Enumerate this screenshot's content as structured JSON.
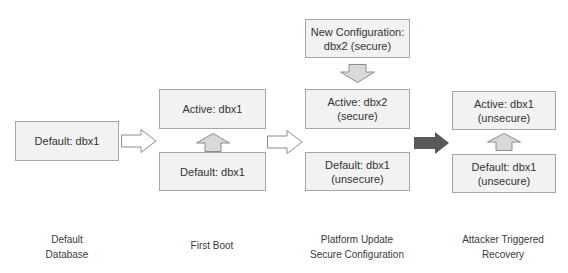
{
  "diagram": {
    "stages": [
      {
        "caption": [
          "Default",
          "Database"
        ],
        "boxes": [
          {
            "role": "default",
            "lines": [
              "Default: dbx1"
            ]
          }
        ]
      },
      {
        "caption": [
          "First Boot"
        ],
        "boxes": [
          {
            "role": "active",
            "lines": [
              "Active: dbx1"
            ]
          },
          {
            "role": "default",
            "lines": [
              "Default: dbx1"
            ]
          }
        ]
      },
      {
        "caption": [
          "Platform Update",
          "Secure Configuration"
        ],
        "boxes": [
          {
            "role": "new-config",
            "lines": [
              "New Configuration:",
              "dbx2 (secure)"
            ]
          },
          {
            "role": "active",
            "lines": [
              "Active: dbx2",
              "(secure)"
            ]
          },
          {
            "role": "default",
            "lines": [
              "Default: dbx1",
              "(unsecure)"
            ]
          }
        ]
      },
      {
        "caption": [
          "Attacker Triggered",
          "Recovery"
        ],
        "boxes": [
          {
            "role": "active",
            "lines": [
              "Active: dbx1",
              "(unsecure)"
            ]
          },
          {
            "role": "default",
            "lines": [
              "Default: dbx1",
              "(unsecure)"
            ]
          }
        ]
      }
    ],
    "arrows": [
      {
        "from": "stage-1",
        "to": "stage-2",
        "style": "outline",
        "direction": "right"
      },
      {
        "from": "stage-2-default",
        "to": "stage-2-active",
        "style": "gray-filled",
        "direction": "up"
      },
      {
        "from": "stage-2",
        "to": "stage-3",
        "style": "outline",
        "direction": "right"
      },
      {
        "from": "stage-3-new-config",
        "to": "stage-3-active",
        "style": "gray-filled",
        "direction": "down"
      },
      {
        "from": "stage-3",
        "to": "stage-4",
        "style": "dark-filled",
        "direction": "right"
      },
      {
        "from": "stage-4-default",
        "to": "stage-4-active",
        "style": "gray-filled",
        "direction": "up"
      }
    ],
    "colors": {
      "box_fill": "#f2f2f2",
      "box_border": "#a6a6a6",
      "arrow_gray_fill": "#d9d9d9",
      "arrow_dark_fill": "#595959",
      "text": "#333333"
    }
  }
}
